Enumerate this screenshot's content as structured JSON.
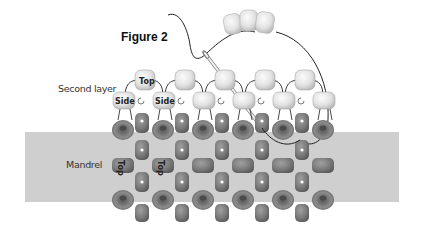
{
  "figure": {
    "title": "Figure 2",
    "labels": {
      "second_layer": "Second layer",
      "mandrel": "Mandrel"
    },
    "bead_labels": {
      "top": "Top",
      "side_left": "Side",
      "side_right": "Side",
      "mandrel_top_1": "Top",
      "mandrel_top_2": "Top"
    },
    "colors": {
      "mandrel": "#cfcfcf",
      "dark_bead": "#7b7b7b",
      "light_bead": "#e2e2e2",
      "thread": "#222222",
      "background": "#ffffff"
    }
  }
}
